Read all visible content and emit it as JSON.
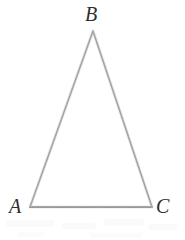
{
  "figure": {
    "name": "triangle-abc",
    "kind": "geometry-diagram",
    "width": 185,
    "height": 240,
    "background_color": "#ffffff",
    "stroke_color": "#b0b0b0",
    "stroke_width": 1.6,
    "label_color": "#2e2e2e",
    "label_font_size": 20,
    "label_style": "italic-serif",
    "shape": "triangle",
    "shape_description": "isosceles triangle with horizontal base",
    "vertices": [
      {
        "id": "A",
        "label": "A",
        "x": 30,
        "y": 207,
        "label_x": 9,
        "label_y": 196,
        "position": "bottom-left"
      },
      {
        "id": "B",
        "label": "B",
        "x": 93,
        "y": 31,
        "label_x": 85,
        "label_y": 4,
        "position": "apex-top"
      },
      {
        "id": "C",
        "label": "C",
        "x": 152,
        "y": 207,
        "label_x": 156,
        "label_y": 196,
        "position": "bottom-right"
      }
    ],
    "edges": [
      {
        "id": "AB",
        "from": "A",
        "to": "B"
      },
      {
        "id": "BC",
        "from": "B",
        "to": "C"
      },
      {
        "id": "CA",
        "from": "C",
        "to": "A"
      }
    ]
  }
}
